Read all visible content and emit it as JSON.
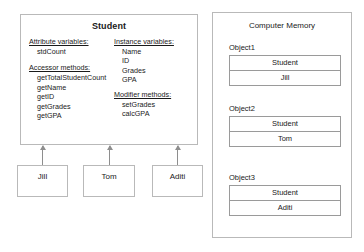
{
  "student_class": {
    "title": "Student",
    "left_column": [
      {
        "heading": "Attribute variables:",
        "items": [
          "stdCount"
        ]
      },
      {
        "heading": "Accessor methods:",
        "items": [
          "getTotalStudentCount",
          "getName",
          "getID",
          "getGrades",
          "getGPA"
        ]
      }
    ],
    "right_column": [
      {
        "heading": "Instance variables:",
        "items": [
          "Name",
          "ID",
          "Grades",
          "GPA"
        ]
      },
      {
        "heading": "Modifier methods:",
        "items": [
          "setGrades",
          "calcGPA"
        ]
      }
    ]
  },
  "instances": [
    {
      "label": "Jill"
    },
    {
      "label": "Tom"
    },
    {
      "label": "Aditi"
    }
  ],
  "memory": {
    "title": "Computer Memory",
    "objects": [
      {
        "label": "Object1",
        "class_name": "Student",
        "value": "Jill"
      },
      {
        "label": "Object2",
        "class_name": "Student",
        "value": "Tom"
      },
      {
        "label": "Object3",
        "class_name": "Student",
        "value": "Aditi"
      }
    ]
  },
  "colors": {
    "background": "#ffffff",
    "border": "#b9b9b9",
    "inner_border": "#9a9a9a",
    "arrow": "#8e8e8e",
    "text": "#1a1a1a"
  }
}
